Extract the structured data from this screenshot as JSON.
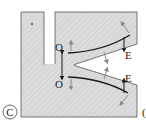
{
  "diagram": {
    "panel_label": "C",
    "next_panel_partial": "(",
    "labels": {
      "origin_top": "O",
      "origin_bottom": "O",
      "end_top": "E",
      "end_bottom": "E"
    },
    "colors": {
      "fill": "#d4d4d4",
      "hatch": "#e6e6e6",
      "outline": "#555555",
      "curve": "#1a1a1a",
      "arrow_gray": "#8a8a8a"
    }
  }
}
